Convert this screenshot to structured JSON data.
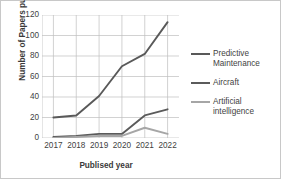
{
  "chart_data": {
    "type": "line",
    "title": "",
    "xlabel": "Publised year",
    "ylabel": "Number of Papers published",
    "categories": [
      "2017",
      "2018",
      "2019",
      "2020",
      "2021",
      "2022"
    ],
    "ylim": [
      0,
      120
    ],
    "yticks": [
      0,
      20,
      40,
      60,
      80,
      100,
      120
    ],
    "ytick_labels": [
      "0",
      "20",
      "40",
      "60",
      "80",
      "100",
      "120"
    ],
    "grid": true,
    "legend_position": "right",
    "series": [
      {
        "name": "Predictive Maintenance",
        "legend_label": "Predictive\nMaintenance",
        "color": "#595959",
        "values": [
          20,
          22,
          41,
          70,
          82,
          113
        ]
      },
      {
        "name": "Aircraft",
        "legend_label": "Aircraft",
        "color": "#5b5b5b",
        "values": [
          1,
          2,
          4,
          4,
          22,
          28
        ]
      },
      {
        "name": "Artificial intelligence",
        "legend_label": "Artificial\nintelligence",
        "color": "#a6a6a6",
        "values": [
          0,
          1,
          2,
          2,
          10,
          4
        ]
      }
    ]
  },
  "colors": {
    "background": "#ffffff",
    "border": "#c8c8c8",
    "gridline": "#bfbfbf",
    "axis_text": "#3f3f3f",
    "title_text": "#3a3a3a"
  }
}
